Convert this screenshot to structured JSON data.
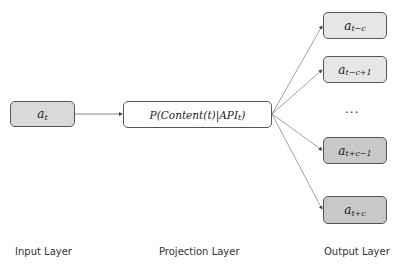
{
  "input": {
    "var": "a",
    "sub": "t",
    "fill": "#d9d9d9"
  },
  "projection": {
    "text": "P(Content(t)|API",
    "sub": "t",
    "close": ")",
    "fill": "#ffffff"
  },
  "outputs": [
    {
      "var": "a",
      "sub": "t−c",
      "fill": "#e6e6e6"
    },
    {
      "var": "a",
      "sub": "t−c+1",
      "fill": "#e6e6e6"
    },
    {
      "var": "a",
      "sub": "t+c−1",
      "fill": "#c8c8c8"
    },
    {
      "var": "a",
      "sub": "t+c",
      "fill": "#c8c8c8"
    }
  ],
  "ellipsis": "···",
  "labels": {
    "input": "Input Layer",
    "projection": "Projection Layer",
    "output": "Output Layer"
  }
}
